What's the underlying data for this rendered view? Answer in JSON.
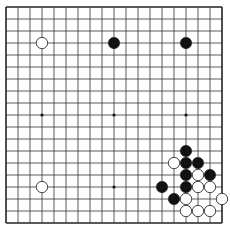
{
  "board": {
    "size": 19,
    "origin_x": 6,
    "origin_y": 7,
    "spacing": 12,
    "line_color": "#333333",
    "border_color": "#222222",
    "star_points": [
      [
        3,
        3
      ],
      [
        9,
        3
      ],
      [
        15,
        3
      ],
      [
        3,
        9
      ],
      [
        9,
        9
      ],
      [
        15,
        9
      ],
      [
        3,
        15
      ],
      [
        9,
        15
      ],
      [
        15,
        15
      ]
    ],
    "stones": [
      {
        "color": "white",
        "col": 3,
        "row": 3
      },
      {
        "color": "black",
        "col": 9,
        "row": 3
      },
      {
        "color": "black",
        "col": 15,
        "row": 3
      },
      {
        "color": "white",
        "col": 3,
        "row": 15
      },
      {
        "color": "black",
        "col": 15,
        "row": 12
      },
      {
        "color": "white",
        "col": 14,
        "row": 13
      },
      {
        "color": "black",
        "col": 15,
        "row": 13
      },
      {
        "color": "black",
        "col": 16,
        "row": 13
      },
      {
        "color": "black",
        "col": 15,
        "row": 14
      },
      {
        "color": "white",
        "col": 16,
        "row": 14
      },
      {
        "color": "black",
        "col": 17,
        "row": 14
      },
      {
        "color": "black",
        "col": 13,
        "row": 15
      },
      {
        "color": "black",
        "col": 15,
        "row": 15
      },
      {
        "color": "white",
        "col": 16,
        "row": 15
      },
      {
        "color": "white",
        "col": 17,
        "row": 15
      },
      {
        "color": "black",
        "col": 14,
        "row": 16
      },
      {
        "color": "white",
        "col": 15,
        "row": 16
      },
      {
        "color": "white",
        "col": 18,
        "row": 16
      },
      {
        "color": "white",
        "col": 15,
        "row": 17
      },
      {
        "color": "white",
        "col": 16,
        "row": 17
      },
      {
        "color": "white",
        "col": 17,
        "row": 17
      }
    ]
  }
}
